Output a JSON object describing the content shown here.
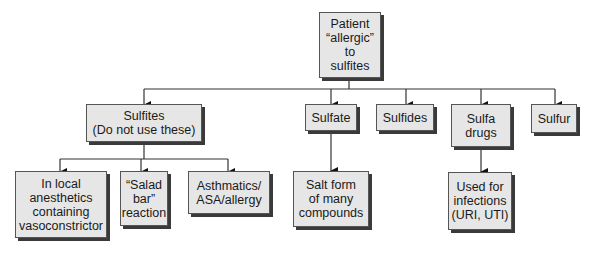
{
  "diagram": {
    "root": {
      "label": "Patient\n“allergic”\nto\nsulfites"
    },
    "level1": [
      {
        "label": "Sulfites\n(Do not use these)"
      },
      {
        "label": "Sulfate"
      },
      {
        "label": "Sulfides"
      },
      {
        "label": "Sulfa\ndrugs"
      },
      {
        "label": "Sulfur"
      }
    ],
    "level2": [
      {
        "label": "In local\nanesthetics\ncontaining\nvasoconstrictor",
        "parent": "Sulfites"
      },
      {
        "label": "“Salad\nbar”\nreaction",
        "parent": "Sulfites"
      },
      {
        "label": "Asthmatics/\nASA/allergy",
        "parent": "Sulfites"
      },
      {
        "label": "Salt form\nof many\ncompounds",
        "parent": "Sulfate"
      },
      {
        "label": "Used for\ninfections\n(URI, UTI)",
        "parent": "Sulfa drugs"
      }
    ]
  }
}
